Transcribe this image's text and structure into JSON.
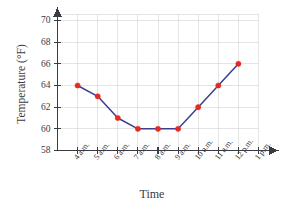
{
  "chart_data": {
    "type": "line",
    "title": "",
    "xlabel": "Time",
    "ylabel": "Temperature (°F)",
    "categories": [
      "4 a.m.",
      "5 a.m.",
      "6 a.m.",
      "7 a.m.",
      "8 a.m.",
      "9 a.m.",
      "10 a.m.",
      "11 a.m.",
      "12 p.m.",
      "1 p.m."
    ],
    "values": [
      64,
      63,
      61,
      60,
      60,
      60,
      62,
      64,
      66,
      null
    ],
    "series": [
      {
        "name": "Temperature",
        "values": [
          64,
          63,
          61,
          60,
          60,
          60,
          62,
          64,
          66,
          null
        ],
        "line_color": "#3c3f8c",
        "marker_color": "#e62a21"
      }
    ],
    "ylim": [
      58,
      70
    ],
    "ytick_labels": [
      "58",
      "60",
      "62",
      "64",
      "66",
      "68",
      "70"
    ],
    "ytick_values": [
      58,
      60,
      62,
      64,
      66,
      68,
      70
    ],
    "grid": true,
    "legend": "none",
    "axis_arrows": true
  },
  "axes": {
    "y_title": "Temperature (°F)",
    "x_title": "Time"
  },
  "colors": {
    "line": "#3c3f8c",
    "marker": "#e62a21",
    "grid": "#d9d9d9",
    "axis": "#3a3a44",
    "background": "#ffffff"
  }
}
